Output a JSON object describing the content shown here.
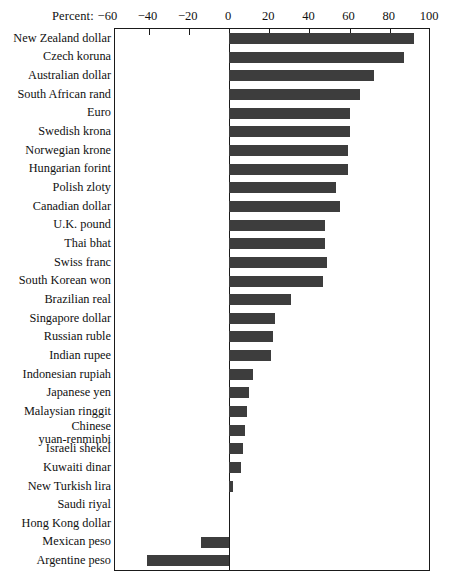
{
  "chart_data": {
    "type": "bar",
    "orientation": "horizontal",
    "title": "",
    "xlabel": "Percent:",
    "ylabel": "",
    "xlim": [
      -56,
      100
    ],
    "grid": false,
    "legend": null,
    "axis_prefix_label": "Percent:",
    "tick_labels": [
      "−60",
      "−40",
      "−20",
      "0",
      "20",
      "40",
      "60",
      "80",
      "100"
    ],
    "tick_values": [
      -60,
      -40,
      -20,
      0,
      20,
      40,
      60,
      80,
      100
    ],
    "bar_color": "#3d3d3d",
    "frame_color": "#1a1a1a",
    "categories": [
      "New Zealand dollar",
      "Czech koruna",
      "Australian dollar",
      "South African rand",
      "Euro",
      "Swedish krona",
      "Norwegian krone",
      "Hungarian forint",
      "Polish zloty",
      "Canadian dollar",
      "U.K. pound",
      "Thai bhat",
      "Swiss franc",
      "South Korean won",
      "Brazilian real",
      "Singapore dollar",
      "Russian ruble",
      "Indian rupee",
      "Indonesian rupiah",
      "Japanese yen",
      "Malaysian ringgit",
      "Chinese\nyuan-renminbi",
      "Israeli shekel",
      "Kuwaiti dinar",
      "New Turkish lira",
      "Saudi riyal",
      "Hong Kong dollar",
      "Mexican peso",
      "Argentine peso"
    ],
    "values": [
      92,
      87,
      72,
      65,
      60,
      60,
      59,
      59,
      53,
      55,
      48,
      48,
      49,
      47,
      31,
      23,
      22,
      21,
      12,
      10,
      9,
      8,
      7,
      6,
      2,
      0,
      0,
      -14,
      -41
    ]
  }
}
